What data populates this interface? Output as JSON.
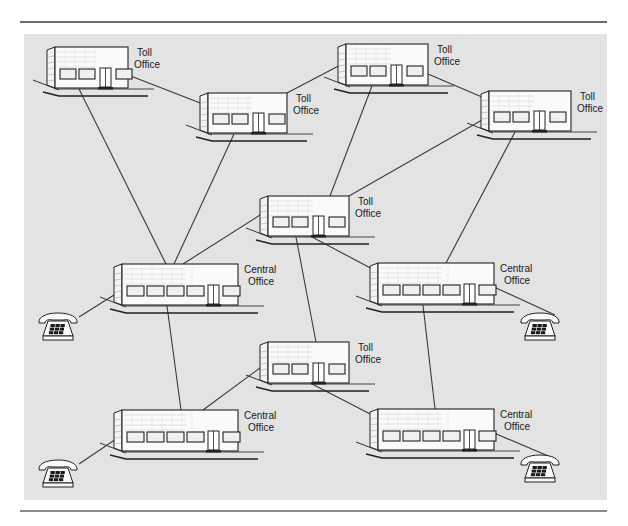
{
  "figure": {
    "background_color": "#e3e3e3",
    "line_color": "#3a3a3a"
  },
  "labels": {
    "toll_line1": "Toll",
    "central_line1": "Central",
    "office_line2": "Office"
  },
  "nodes": [
    {
      "id": "toll-1",
      "type": "toll",
      "x": 55,
      "y": 47,
      "w": 73,
      "h": 41,
      "windows": 3,
      "label": [
        "Toll",
        "Office"
      ]
    },
    {
      "id": "toll-2",
      "type": "toll",
      "x": 208,
      "y": 93,
      "w": 79,
      "h": 40,
      "windows": 3,
      "label": [
        "Toll",
        "Office"
      ]
    },
    {
      "id": "toll-3",
      "type": "toll",
      "x": 346,
      "y": 44,
      "w": 82,
      "h": 41,
      "windows": 3,
      "label": [
        "Toll",
        "Office"
      ]
    },
    {
      "id": "toll-4",
      "type": "toll",
      "x": 489,
      "y": 91,
      "w": 82,
      "h": 40,
      "windows": 3,
      "label": [
        "Toll",
        "Office"
      ]
    },
    {
      "id": "toll-5",
      "type": "toll",
      "x": 268,
      "y": 196,
      "w": 81,
      "h": 40,
      "windows": 3,
      "label": [
        "Toll",
        "Office"
      ]
    },
    {
      "id": "central-1",
      "type": "central",
      "x": 122,
      "y": 264,
      "w": 116,
      "h": 41,
      "windows": 5,
      "label": [
        "Central",
        "Office"
      ]
    },
    {
      "id": "central-2",
      "type": "central",
      "x": 378,
      "y": 263,
      "w": 116,
      "h": 41,
      "windows": 5,
      "label": [
        "Central",
        "Office"
      ]
    },
    {
      "id": "toll-6",
      "type": "toll",
      "x": 268,
      "y": 342,
      "w": 81,
      "h": 41,
      "windows": 3,
      "label": [
        "Toll",
        "Office"
      ]
    },
    {
      "id": "central-3",
      "type": "central",
      "x": 122,
      "y": 410,
      "w": 116,
      "h": 41,
      "windows": 5,
      "label": [
        "Central",
        "Office"
      ]
    },
    {
      "id": "central-4",
      "type": "central",
      "x": 378,
      "y": 409,
      "w": 116,
      "h": 41,
      "windows": 5,
      "label": [
        "Central",
        "Office"
      ]
    }
  ],
  "phones": [
    {
      "id": "phone-1",
      "x": 38,
      "y": 313
    },
    {
      "id": "phone-2",
      "x": 520,
      "y": 313
    },
    {
      "id": "phone-3",
      "x": 38,
      "y": 460
    },
    {
      "id": "phone-4",
      "x": 520,
      "y": 455
    }
  ],
  "links": [
    {
      "from": "toll-1",
      "to": "toll-2",
      "x1": 128,
      "y1": 75,
      "x2": 208,
      "y2": 106
    },
    {
      "from": "toll-2",
      "to": "toll-3",
      "x1": 287,
      "y1": 93,
      "x2": 346,
      "y2": 62
    },
    {
      "from": "toll-3",
      "to": "toll-4",
      "x1": 428,
      "y1": 74,
      "x2": 489,
      "y2": 100
    },
    {
      "from": "toll-1",
      "to": "central-1",
      "x1": 79,
      "y1": 89,
      "x2": 166,
      "y2": 264
    },
    {
      "from": "toll-2",
      "to": "central-1",
      "x1": 234,
      "y1": 134,
      "x2": 174,
      "y2": 264
    },
    {
      "from": "toll-3",
      "to": "toll-5",
      "x1": 372,
      "y1": 86,
      "x2": 330,
      "y2": 196
    },
    {
      "from": "toll-4",
      "to": "toll-5",
      "x1": 489,
      "y1": 116,
      "x2": 349,
      "y2": 196
    },
    {
      "from": "toll-4",
      "to": "central-2",
      "x1": 515,
      "y1": 132,
      "x2": 446,
      "y2": 263
    },
    {
      "from": "toll-5",
      "to": "central-1",
      "x1": 268,
      "y1": 210,
      "x2": 183,
      "y2": 264
    },
    {
      "from": "toll-5",
      "to": "central-2",
      "x1": 312,
      "y1": 237,
      "x2": 378,
      "y2": 272
    },
    {
      "from": "toll-5",
      "to": "toll-6",
      "x1": 296,
      "y1": 237,
      "x2": 316,
      "y2": 342
    },
    {
      "from": "central-1",
      "to": "central-3",
      "x1": 167,
      "y1": 306,
      "x2": 181,
      "y2": 410
    },
    {
      "from": "central-2",
      "to": "central-4",
      "x1": 423,
      "y1": 305,
      "x2": 435,
      "y2": 409
    },
    {
      "from": "toll-6",
      "to": "central-3",
      "x1": 268,
      "y1": 362,
      "x2": 203,
      "y2": 410
    },
    {
      "from": "toll-6",
      "to": "central-4",
      "x1": 312,
      "y1": 384,
      "x2": 378,
      "y2": 418
    },
    {
      "from": "central-1",
      "to": "phone-1",
      "x1": 122,
      "y1": 290,
      "x2": 79,
      "y2": 317
    },
    {
      "from": "central-2",
      "to": "phone-2",
      "x1": 494,
      "y1": 287,
      "x2": 555,
      "y2": 315
    },
    {
      "from": "central-3",
      "to": "phone-3",
      "x1": 122,
      "y1": 435,
      "x2": 79,
      "y2": 464
    },
    {
      "from": "central-4",
      "to": "phone-4",
      "x1": 494,
      "y1": 433,
      "x2": 553,
      "y2": 458
    }
  ]
}
